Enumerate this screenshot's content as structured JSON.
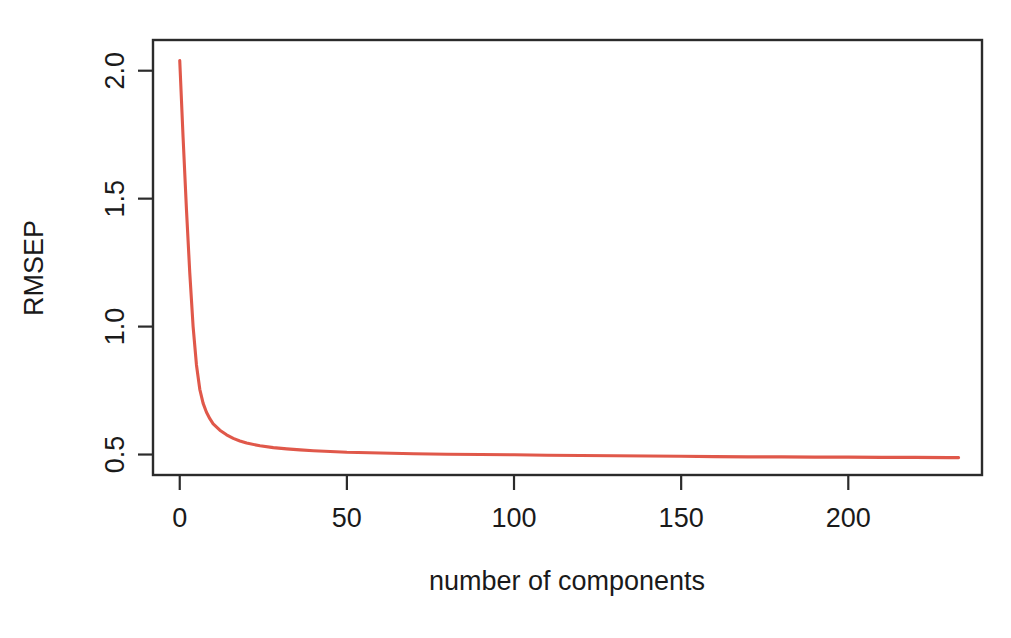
{
  "chart_data": {
    "type": "line",
    "title": "",
    "xlabel": "number of components",
    "ylabel": "RMSEP",
    "xlim": [
      -8,
      240
    ],
    "ylim": [
      0.42,
      2.12
    ],
    "grid": false,
    "legend": null,
    "series_color": "#e0584a",
    "background_color": "#ffffff",
    "axis_color": "#2b2b2b",
    "xticks": [
      0,
      50,
      100,
      150,
      200
    ],
    "xtick_labels": [
      "0",
      "50",
      "100",
      "150",
      "200"
    ],
    "yticks": [
      0.5,
      1.0,
      1.5,
      2.0
    ],
    "ytick_labels": [
      "0.5",
      "1.0",
      "1.5",
      "2.0"
    ],
    "series": [
      {
        "name": "RMSEP",
        "x": [
          0,
          1,
          2,
          3,
          4,
          5,
          6,
          7,
          8,
          9,
          10,
          12,
          14,
          16,
          18,
          20,
          24,
          28,
          32,
          36,
          40,
          50,
          60,
          70,
          80,
          90,
          100,
          110,
          120,
          130,
          140,
          150,
          160,
          170,
          180,
          190,
          200,
          210,
          220,
          230,
          233
        ],
        "y": [
          2.04,
          1.74,
          1.46,
          1.21,
          1.0,
          0.85,
          0.755,
          0.7,
          0.665,
          0.64,
          0.62,
          0.595,
          0.577,
          0.563,
          0.553,
          0.545,
          0.534,
          0.527,
          0.522,
          0.518,
          0.515,
          0.509,
          0.506,
          0.503,
          0.501,
          0.5,
          0.499,
          0.497,
          0.496,
          0.495,
          0.494,
          0.493,
          0.492,
          0.491,
          0.491,
          0.49,
          0.49,
          0.489,
          0.489,
          0.488,
          0.488
        ]
      }
    ]
  },
  "axes": {
    "y_title": "RMSEP",
    "x_title": "number of components",
    "x_tick_labels": [
      "0",
      "50",
      "100",
      "150",
      "200"
    ],
    "y_tick_labels": [
      "0.5",
      "1.0",
      "1.5",
      "2.0"
    ]
  }
}
